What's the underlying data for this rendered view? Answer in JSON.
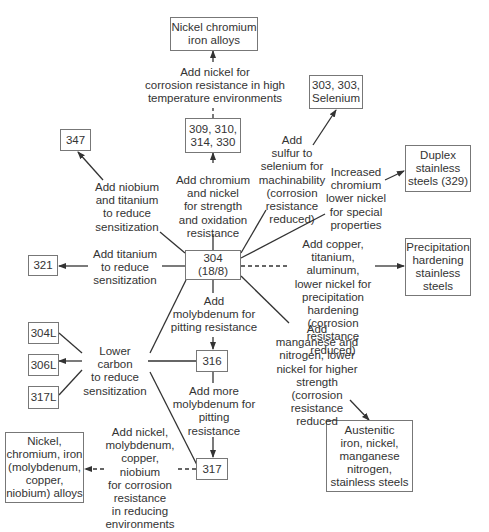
{
  "nodes": {
    "nickel_chromium_iron": "Nickel chromium\niron alloys",
    "n309": "309, 310,\n314, 330",
    "n303": "303, 303,\nSelenium",
    "n347": "347",
    "duplex": "Duplex\nstainless\nsteels (329)",
    "n321": "321",
    "n304": "304\n(18/8)",
    "precipitation": "Precipitation\nhardening\nstainless\nsteels",
    "n304L": "304L",
    "n306L": "306L",
    "n317L": "317L",
    "n316": "316",
    "n317": "317",
    "nickel_alloys": "Nickel,\nchromium, iron\n(molybdenum,\ncopper,\nniobium) alloys",
    "austenitic": "Austenitic\niron, nickel,\nmanganese\nnitrogen,\nstainless steels"
  },
  "labels": {
    "add_nickel_high_temp": "Add nickel for\ncorrosion resistance in high\ntemperature environments",
    "add_sulfur": "Add\nsulfur to\nselenium for\nmachinability\n(corrosion\nresistance\nreduced)",
    "add_niobium_titanium": "Add niobium\nand titanium\nto reduce\nsensitization",
    "add_chromium_nickel": "Add chromium\nand nickel\nfor strength\nand oxidation\nresistance",
    "increased_chromium": "Increased\nchromium\nlower nickel\nfor special\nproperties",
    "add_titanium": "Add titanium\nto reduce\nsensitization",
    "add_copper": "Add copper,\ntitanium, aluminum,\nlower nickel for\nprecipitation\nhardening (corrosion\nresistance reduced)",
    "add_molybdenum": "Add\nmolybdenum for\npitting resistance",
    "lower_carbon": "Lower carbon\nto reduce\nsensitization",
    "add_manganese": "Add\nmanganese and\nnitrogen, lower\nnickel for higher\nstrength (corrosion\nresistance reduced",
    "add_more_molybdenum": "Add more\nmolybdenum for\npitting\nresistance",
    "add_nickel_reducing": "Add nickel,\nmolybdenum,\ncopper, niobium\nfor corrosion\nresistance\nin reducing\nenvironments"
  },
  "colors": {
    "line": "#333333",
    "box_border": "#777777",
    "text": "#333333"
  }
}
